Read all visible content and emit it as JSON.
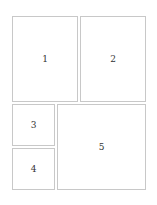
{
  "diagram": {
    "type": "page-layout",
    "panels": [
      {
        "id": "panel-1",
        "label": "1",
        "x": 12,
        "y": 16,
        "w": 66,
        "h": 86
      },
      {
        "id": "panel-2",
        "label": "2",
        "x": 80,
        "y": 16,
        "w": 66,
        "h": 86
      },
      {
        "id": "panel-3",
        "label": "3",
        "x": 12,
        "y": 104,
        "w": 43,
        "h": 42
      },
      {
        "id": "panel-4",
        "label": "4",
        "x": 12,
        "y": 148,
        "w": 43,
        "h": 42
      },
      {
        "id": "panel-5",
        "label": "5",
        "x": 57,
        "y": 104,
        "w": 89,
        "h": 86
      }
    ],
    "colors": {
      "border": "#c8c8c8",
      "background": "#ffffff",
      "text": "#333333"
    }
  }
}
